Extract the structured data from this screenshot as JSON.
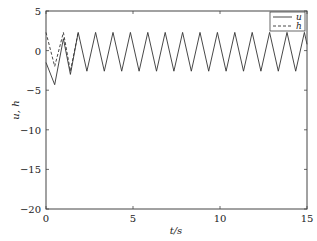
{
  "chart_data": {
    "type": "line",
    "title": "",
    "xlabel": "t/s",
    "ylabel": "u, h",
    "xlim": [
      0,
      15
    ],
    "ylim": [
      -20,
      5
    ],
    "xticks": [
      0,
      5,
      10,
      15
    ],
    "yticks": [
      5,
      0,
      -5,
      -10,
      -15,
      -20
    ],
    "grid": false,
    "legend_position": "upper right",
    "series": [
      {
        "name": "u",
        "style": "solid",
        "color": "#333333",
        "x": [
          0,
          0.5,
          1.0,
          1.4,
          1.85,
          2.35,
          2.85,
          3.35,
          3.85,
          4.35,
          4.85,
          5.35,
          5.85,
          6.35,
          6.85,
          7.35,
          7.85,
          8.35,
          8.85,
          9.35,
          9.85,
          10.35,
          10.85,
          11.35,
          11.85,
          12.35,
          12.85,
          13.35,
          13.85,
          14.35,
          14.85,
          15.0
        ],
        "y": [
          -1.5,
          -4.3,
          1.5,
          -3.0,
          2.3,
          -2.6,
          2.3,
          -2.6,
          2.3,
          -2.6,
          2.3,
          -2.6,
          2.3,
          -2.6,
          2.3,
          -2.6,
          2.3,
          -2.6,
          2.3,
          -2.6,
          2.3,
          -2.6,
          2.3,
          -2.6,
          2.3,
          -2.6,
          2.3,
          -2.6,
          2.3,
          -2.6,
          2.3,
          0.8
        ]
      },
      {
        "name": "h",
        "style": "dashed",
        "color": "#333333",
        "x": [
          0,
          0.5,
          1.0,
          1.4,
          1.85
        ],
        "y": [
          2.3,
          -2.0,
          2.3,
          -2.6,
          2.3
        ]
      }
    ]
  },
  "axes": {
    "x_tick_labels": [
      "0",
      "5",
      "10",
      "15"
    ],
    "y_tick_labels": [
      "5",
      "0",
      "−5",
      "−10",
      "−15",
      "−20"
    ],
    "xlabel": "t/s",
    "ylabel": "u, h"
  },
  "legend": {
    "items": [
      {
        "label": "u",
        "style": "solid"
      },
      {
        "label": "h",
        "style": "dashed"
      }
    ]
  }
}
